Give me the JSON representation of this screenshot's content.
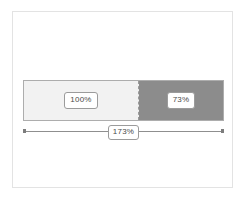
{
  "figure": {
    "type": "stacked-comparison-bar",
    "background_color": "#ffffff",
    "frame_color": "#e3e3e3"
  },
  "chart_data": {
    "type": "bar",
    "orientation": "horizontal",
    "stacked": true,
    "title": "",
    "subtitle": "",
    "xlabel": "",
    "ylabel": "",
    "grid": false,
    "legend": "none",
    "categories": [
      "Total"
    ],
    "series": [
      {
        "name": "100%",
        "values": [
          100
        ],
        "color": "#f2f2f2",
        "label": "100%"
      },
      {
        "name": "73%",
        "values": [
          73
        ],
        "color": "#8c8c8c",
        "label": "73%"
      }
    ],
    "total_label": "173%",
    "total_value": 173,
    "xlim": [
      0,
      173
    ],
    "annotations": [
      {
        "text": "100%",
        "segment": "base",
        "position": "center"
      },
      {
        "text": "73%",
        "segment": "extra",
        "position": "center"
      },
      {
        "text": "173%",
        "segment": "total",
        "position": "below-center"
      }
    ]
  },
  "bar": {
    "border_color": "#adadad",
    "divider_style": "dashed",
    "divider_color": "#9a9a9a",
    "base": {
      "label": "100%",
      "fill_color": "#f2f2f2"
    },
    "extra": {
      "label": "73%",
      "fill_color": "#8c8c8c"
    }
  },
  "dimension": {
    "label": "173%",
    "line_color": "#8f8f8f",
    "cap_color": "#7d7d7d"
  }
}
